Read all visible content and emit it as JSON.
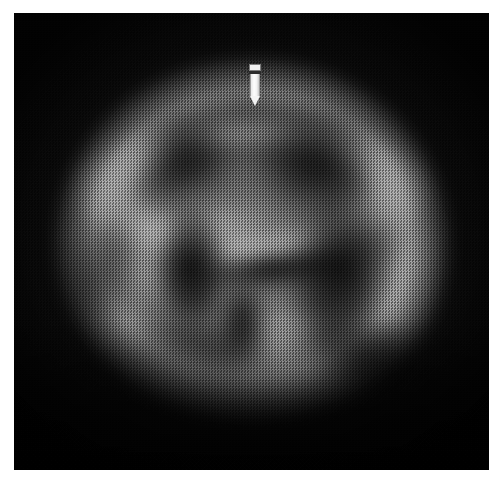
{
  "figure": {
    "modality_appearance": "grayscale-halftone-scan",
    "orientation": "axial-slice",
    "background_color": "#0a0a0a",
    "page_color": "#ffffff",
    "plate": {
      "x": 14,
      "y": 13,
      "width": 475,
      "height": 457
    }
  },
  "annotations": {
    "marker": {
      "name": "pointer-marker",
      "shape": "rectangle-with-pointed-tip",
      "color": "#f4f4f4",
      "band_color": "#2b2b2b",
      "x": 249,
      "y": 64,
      "width": 12,
      "height": 42,
      "tip_x": 255,
      "tip_y": 106
    }
  },
  "anatomy": {
    "regions": [
      {
        "name": "skull-rim",
        "intensity": "bright",
        "role": "outer cortical / skull rim"
      },
      {
        "name": "cortical-arc",
        "intensity": "bright",
        "role": "superior cortical band"
      },
      {
        "name": "parenchyma",
        "intensity": "mid-gray",
        "role": "brain parenchyma"
      },
      {
        "name": "left-temporal-lobe",
        "intensity": "bright",
        "role": "left temporal uptake"
      },
      {
        "name": "right-temporal-lobe",
        "intensity": "bright",
        "role": "right temporal uptake"
      },
      {
        "name": "midline-structure",
        "intensity": "bright",
        "role": "central midline structure"
      },
      {
        "name": "left-ventricle",
        "intensity": "dark",
        "role": "left ventricular cavity"
      },
      {
        "name": "right-dark-mass",
        "intensity": "dark",
        "role": "right ventricular cavity"
      },
      {
        "name": "dark-connector",
        "intensity": "dark",
        "role": "interconnecting dark band"
      },
      {
        "name": "dark-stem",
        "intensity": "dark",
        "role": "inferior midline recess"
      },
      {
        "name": "frontal-notch-left",
        "intensity": "dark",
        "role": "left frontal low signal"
      },
      {
        "name": "frontal-notch-right",
        "intensity": "dark",
        "role": "right frontal low signal"
      },
      {
        "name": "inferior-band",
        "intensity": "mid-bright",
        "role": "inferior / cerebellar band"
      }
    ]
  },
  "texture": {
    "pattern": "halftone-checkerboard-dither",
    "cell_size_px": 3,
    "note": "scanned printed reproduction"
  }
}
